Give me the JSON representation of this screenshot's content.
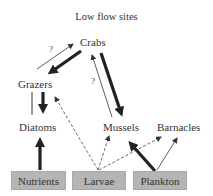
{
  "title": "Low flow sites",
  "nodes": {
    "crabs": "Crabs",
    "grazers": "Grazers",
    "diatoms": "Diatoms",
    "mussels": "Mussels",
    "barnacles": "Barnacles"
  },
  "sources": {
    "nutrients": "Nutrients",
    "larvae": "Larvae",
    "plankton": "Plankton"
  },
  "source_box_color": "#b5b5b5",
  "uncertain_marks": {
    "grazers_to_crabs": "?",
    "mussels_to_crabs": "?"
  },
  "edges": [
    {
      "from": "Grazers",
      "to": "Crabs",
      "style": "thin",
      "label": "?"
    },
    {
      "from": "Crabs",
      "to": "Grazers",
      "style": "thick"
    },
    {
      "from": "Crabs",
      "to": "Mussels",
      "style": "thick"
    },
    {
      "from": "Mussels",
      "to": "Crabs",
      "style": "thin",
      "label": "?"
    },
    {
      "from": "Grazers",
      "to": "Diatoms",
      "style": "thick"
    },
    {
      "from": "Diatoms",
      "to": "Grazers",
      "style": "thin-line"
    },
    {
      "from": "Nutrients",
      "to": "Diatoms",
      "style": "thick"
    },
    {
      "from": "Larvae",
      "to": "Grazers",
      "style": "dashed"
    },
    {
      "from": "Larvae",
      "to": "Mussels",
      "style": "dashed"
    },
    {
      "from": "Larvae",
      "to": "Barnacles",
      "style": "dashed"
    },
    {
      "from": "Plankton",
      "to": "Mussels",
      "style": "thick"
    },
    {
      "from": "Plankton",
      "to": "Barnacles",
      "style": "thin"
    }
  ]
}
